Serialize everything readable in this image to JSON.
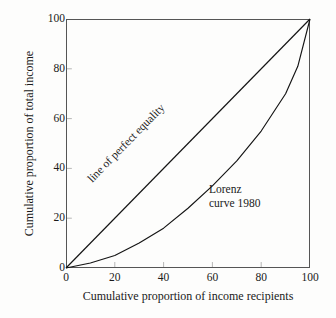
{
  "chart_data": {
    "type": "line",
    "title": "",
    "xlabel": "Cumulative proportion of income recipients",
    "ylabel": "Cumulative proportion of total income",
    "xlim": [
      0,
      100
    ],
    "ylim": [
      0,
      100
    ],
    "xticks": [
      "0",
      "20",
      "40",
      "60",
      "80",
      "100"
    ],
    "yticks": [
      "0",
      "20",
      "40",
      "60",
      "80",
      "100"
    ],
    "xtick_values": [
      0,
      20,
      40,
      60,
      80,
      100
    ],
    "ytick_values": [
      0,
      20,
      40,
      60,
      80,
      100
    ],
    "grid": false,
    "legend": "none",
    "series": [
      {
        "name": "line of perfect equality",
        "x": [
          0,
          100
        ],
        "values": [
          0,
          100
        ]
      },
      {
        "name": "Lorenz curve 1980",
        "x": [
          0,
          10,
          20,
          30,
          40,
          50,
          60,
          70,
          80,
          90,
          95,
          100
        ],
        "values": [
          0,
          2,
          5,
          10,
          16,
          24,
          33,
          43,
          55,
          70,
          81,
          100
        ]
      }
    ],
    "annotations": [
      {
        "text": "line of perfect equality",
        "x": 30,
        "y": 37,
        "rotation": -45.6
      },
      {
        "text": "Lorenz",
        "x": 59,
        "y": 36,
        "rotation": 0
      },
      {
        "text": "curve 1980",
        "x": 59,
        "y": 30,
        "rotation": 0
      }
    ]
  },
  "axes": {
    "x_title": "Cumulative proportion of income recipients",
    "y_title": "Cumulative proportion of total income",
    "x_tick_labels": [
      "0",
      "20",
      "40",
      "60",
      "80",
      "100"
    ],
    "y_tick_labels": [
      "0",
      "20",
      "40",
      "60",
      "80",
      "100"
    ]
  },
  "labels": {
    "equality_line": "line of perfect equality",
    "lorenz_line1": "Lorenz",
    "lorenz_line2": "curve 1980"
  },
  "colors": {
    "background": "#fdfdfc",
    "axis": "#555555",
    "curve": "#141414",
    "text": "#1a1a1a"
  }
}
